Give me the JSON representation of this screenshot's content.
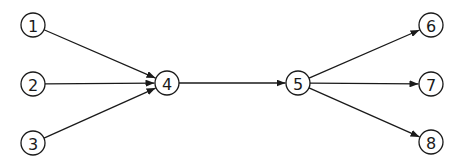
{
  "diagram": {
    "type": "directed-graph",
    "node_radius": 12,
    "colors": {
      "stroke": "#1a1a1a",
      "fill": "#ffffff",
      "background": "#ffffff"
    },
    "nodes": [
      {
        "id": "1",
        "label": "1",
        "x": 33,
        "y": 25
      },
      {
        "id": "2",
        "label": "2",
        "x": 33,
        "y": 84
      },
      {
        "id": "3",
        "label": "3",
        "x": 33,
        "y": 143
      },
      {
        "id": "4",
        "label": "4",
        "x": 167,
        "y": 83
      },
      {
        "id": "5",
        "label": "5",
        "x": 298,
        "y": 83
      },
      {
        "id": "6",
        "label": "6",
        "x": 431,
        "y": 25
      },
      {
        "id": "7",
        "label": "7",
        "x": 431,
        "y": 84
      },
      {
        "id": "8",
        "label": "8",
        "x": 431,
        "y": 142
      }
    ],
    "edges": [
      {
        "from": "1",
        "to": "4"
      },
      {
        "from": "2",
        "to": "4"
      },
      {
        "from": "3",
        "to": "4"
      },
      {
        "from": "4",
        "to": "5"
      },
      {
        "from": "5",
        "to": "6"
      },
      {
        "from": "5",
        "to": "7"
      },
      {
        "from": "5",
        "to": "8"
      }
    ]
  }
}
